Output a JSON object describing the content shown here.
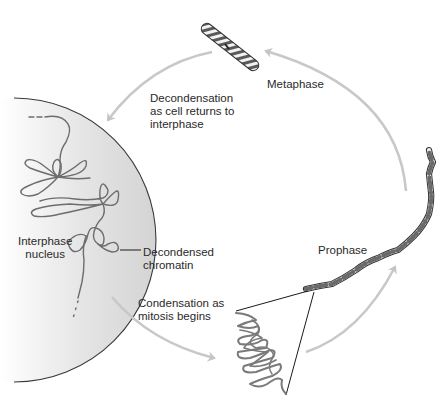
{
  "diagram": {
    "type": "cell-cycle chromosome condensation cycle",
    "colors": {
      "background": "#ffffff",
      "nucleus_fill_light": "#ffffff",
      "nucleus_fill_dark": "#d6d6d6",
      "nucleus_outline": "#3a3a3a",
      "arrow": "#c8c8c8",
      "chromatin": "#6a6a6a",
      "chromosome_band_dark": "#555555",
      "chromosome_band_light": "#f0f0f0",
      "text": "#2a2a2a",
      "leader_line": "#1a1a1a"
    },
    "stages": [
      {
        "id": "metaphase",
        "label": "Metaphase"
      },
      {
        "id": "prophase",
        "label": "Prophase"
      },
      {
        "id": "interphase",
        "label": "Interphase\nnucleus"
      }
    ],
    "transitions": [
      {
        "from": "metaphase",
        "to": "interphase",
        "label": "Decondensation\nas cell returns to\ninterphase"
      },
      {
        "from": "interphase",
        "to": "prophase",
        "label": "Condensation as\nmitosis begins"
      },
      {
        "from": "prophase",
        "to": "metaphase",
        "label": ""
      }
    ],
    "callouts": [
      {
        "target": "chromatin-loop",
        "label": "Decondensed\nchromatin"
      }
    ]
  }
}
